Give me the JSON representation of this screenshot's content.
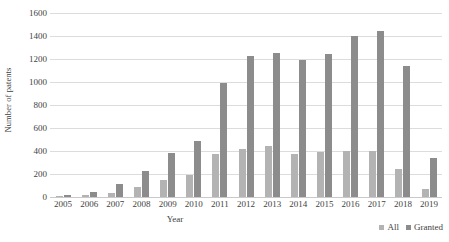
{
  "chart_data": {
    "type": "bar",
    "title": "",
    "xlabel": "Year",
    "ylabel": "Number of patents",
    "categories": [
      "2005",
      "2006",
      "2007",
      "2008",
      "2009",
      "2010",
      "2011",
      "2012",
      "2013",
      "2014",
      "2015",
      "2016",
      "2017",
      "2018",
      "2019"
    ],
    "series": [
      {
        "name": "All",
        "color": "#b3b3b3",
        "values": [
          10,
          15,
          35,
          90,
          150,
          190,
          375,
          420,
          440,
          370,
          395,
          400,
          400,
          240,
          70
        ]
      },
      {
        "name": "Granted",
        "color": "#8c8c8c",
        "values": [
          20,
          40,
          110,
          225,
          385,
          490,
          990,
          1230,
          1250,
          1190,
          1240,
          1400,
          1440,
          1140,
          340
        ]
      }
    ],
    "ylim": [
      0,
      1600
    ],
    "ytick_step": 200,
    "yticks": [
      1600,
      1400,
      1200,
      1000,
      800,
      600,
      400,
      200,
      0
    ],
    "grid": true,
    "grid_axis": "y",
    "legend_position": "bottom-right",
    "gridline_color": "#dcdcdc",
    "text_color": "#3f3f3f",
    "background": "#ffffff"
  }
}
